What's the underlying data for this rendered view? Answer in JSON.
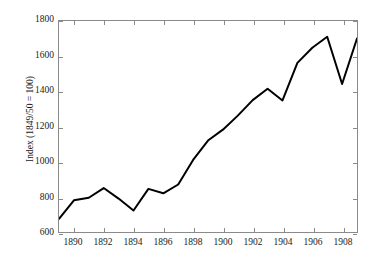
{
  "chart_data": {
    "type": "line",
    "title": "",
    "subtitle": "",
    "xlabel": "",
    "ylabel": "Index (1849/50 = 100)",
    "xlim": [
      1889,
      1909
    ],
    "ylim": [
      600,
      1800
    ],
    "xticks": [
      1890,
      1892,
      1894,
      1896,
      1898,
      1900,
      1902,
      1904,
      1906,
      1908
    ],
    "xtick_labels": [
      "1890",
      "1892",
      "1894",
      "1896",
      "1898",
      "1900",
      "1902",
      "1904",
      "1906",
      "1908"
    ],
    "yticks": [
      600,
      800,
      1000,
      1200,
      1400,
      1600,
      1800
    ],
    "ytick_labels": [
      "600",
      "800",
      "1000",
      "1200",
      "1400",
      "1600",
      "1800"
    ],
    "grid": false,
    "legend": null,
    "line_color": "#000000",
    "line_width": 2,
    "axis_color": "#8a8a8a",
    "background_color": "#ffffff",
    "x": [
      1889,
      1890,
      1891,
      1892,
      1893,
      1894,
      1895,
      1896,
      1897,
      1898,
      1899,
      1900,
      1901,
      1902,
      1903,
      1904,
      1905,
      1906,
      1907,
      1908,
      1909
    ],
    "values": [
      675,
      780,
      795,
      850,
      790,
      722,
      845,
      820,
      870,
      1010,
      1120,
      1182,
      1262,
      1350,
      1415,
      1348,
      1562,
      1648,
      1710,
      1442,
      1700
    ],
    "series": [
      {
        "name": "Index",
        "values": [
          675,
          780,
          795,
          850,
          790,
          722,
          845,
          820,
          870,
          1010,
          1120,
          1182,
          1262,
          1350,
          1415,
          1348,
          1562,
          1648,
          1710,
          1442,
          1700
        ]
      }
    ]
  }
}
